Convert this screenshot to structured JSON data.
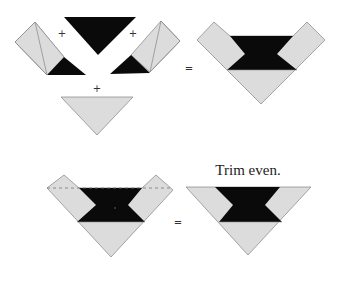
{
  "diagram": {
    "colors": {
      "light_fabric": "#dcdcdc",
      "dark_fabric": "#0a0a0a",
      "outline": "#8f8f8f"
    },
    "step1": {
      "operators": [
        "+",
        "+",
        "+",
        "="
      ],
      "pieces": [
        {
          "name": "left-strip-with-dark-corner"
        },
        {
          "name": "top-dark-triangle"
        },
        {
          "name": "right-strip-with-dark-corner"
        },
        {
          "name": "bottom-light-triangle"
        }
      ],
      "result": "assembled-v-block"
    },
    "step2": {
      "operators": [
        "="
      ],
      "caption": "Trim even.",
      "trim_line": "dashed",
      "result": "trimmed-triangle-block"
    }
  }
}
